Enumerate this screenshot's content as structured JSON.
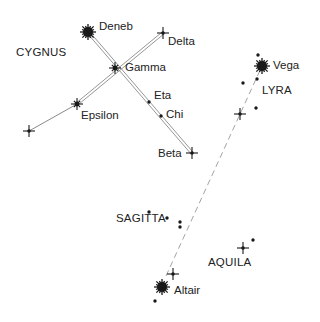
{
  "colors": {
    "ink": "#1a1a1a",
    "line": "#8a8a8a",
    "background": "#ffffff"
  },
  "constellations": [
    {
      "name": "CYGNUS",
      "x": 16,
      "y": 53
    },
    {
      "name": "LYRA",
      "x": 262,
      "y": 91
    },
    {
      "name": "SAGITTA",
      "x": 116,
      "y": 219
    },
    {
      "name": "AQUILA",
      "x": 208,
      "y": 263
    }
  ],
  "stars": [
    {
      "name": "Deneb",
      "type": "bright",
      "x": 88,
      "y": 32,
      "label_x": 99,
      "label_y": 21
    },
    {
      "name": "Delta",
      "type": "cross",
      "x": 163,
      "y": 33,
      "label_x": 168,
      "label_y": 36
    },
    {
      "name": "Gamma",
      "type": "star",
      "x": 115,
      "y": 68,
      "label_x": 125,
      "label_y": 62
    },
    {
      "name": "Epsilon",
      "type": "star",
      "x": 77,
      "y": 104,
      "label_x": 81,
      "label_y": 110
    },
    {
      "name": "",
      "type": "cross",
      "x": 29,
      "y": 131
    },
    {
      "name": "Eta",
      "type": "dot",
      "x": 149,
      "y": 102,
      "label_x": 154,
      "label_y": 90
    },
    {
      "name": "Chi",
      "type": "dot",
      "x": 161,
      "y": 116,
      "label_x": 166,
      "label_y": 109
    },
    {
      "name": "Beta",
      "type": "cross",
      "x": 192,
      "y": 153,
      "label_x": 158,
      "label_y": 148
    },
    {
      "name": "Vega",
      "type": "bright",
      "x": 262,
      "y": 66,
      "label_x": 273,
      "label_y": 60
    },
    {
      "name": "",
      "type": "dot",
      "x": 258,
      "y": 55
    },
    {
      "name": "",
      "type": "dot",
      "x": 243,
      "y": 83
    },
    {
      "name": "",
      "type": "dot",
      "x": 257,
      "y": 79
    },
    {
      "name": "",
      "type": "dot",
      "x": 256,
      "y": 108
    },
    {
      "name": "",
      "type": "cross",
      "x": 240,
      "y": 114
    },
    {
      "name": "",
      "type": "dot",
      "x": 149,
      "y": 212
    },
    {
      "name": "",
      "type": "dot",
      "x": 167,
      "y": 218
    },
    {
      "name": "",
      "type": "dot",
      "x": 180,
      "y": 222
    },
    {
      "name": "",
      "type": "dot",
      "x": 180,
      "y": 227
    },
    {
      "name": "",
      "type": "cross",
      "x": 243,
      "y": 248
    },
    {
      "name": "",
      "type": "dot",
      "x": 253,
      "y": 240
    },
    {
      "name": "",
      "type": "cross",
      "x": 173,
      "y": 274
    },
    {
      "name": "Altair",
      "type": "bright",
      "x": 162,
      "y": 287,
      "label_x": 174,
      "label_y": 285
    },
    {
      "name": "",
      "type": "dot",
      "x": 155,
      "y": 301
    }
  ],
  "lines": [
    {
      "from": "Deneb",
      "to": "Beta",
      "x1": 88,
      "y1": 32,
      "x2": 192,
      "y2": 153,
      "style": "double"
    },
    {
      "from": "Delta",
      "to": "Epsilon",
      "x1": 163,
      "y1": 33,
      "x2": 77,
      "y2": 104,
      "style": "double"
    },
    {
      "from": "Epsilon",
      "to": "far-left",
      "x1": 77,
      "y1": 104,
      "x2": 29,
      "y2": 131,
      "style": "single"
    },
    {
      "from": "Altair",
      "to": "Vega",
      "x1": 166,
      "y1": 276,
      "x2": 262,
      "y2": 66,
      "style": "dashed"
    }
  ]
}
